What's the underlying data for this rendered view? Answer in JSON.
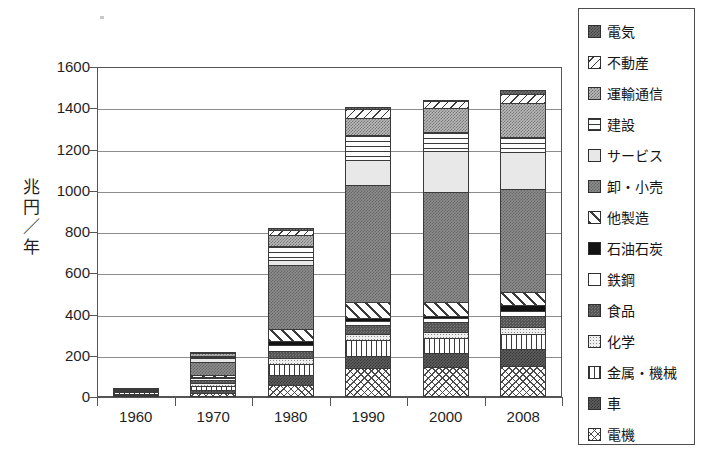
{
  "chart_data": {
    "type": "bar",
    "stacked": true,
    "title": "",
    "xlabel": "",
    "ylabel": "兆円／年",
    "ylabel_chars": [
      "兆",
      "円",
      "／",
      "年"
    ],
    "ylim": [
      0,
      1600
    ],
    "ytick_step": 200,
    "yticks": [
      0,
      200,
      400,
      600,
      800,
      1000,
      1200,
      1400,
      1600
    ],
    "ytick_labels": [
      "0",
      "200",
      "400",
      "600",
      "800",
      "1000",
      "1200",
      "1400",
      "1600"
    ],
    "grid": true,
    "grid_axis": "y",
    "legend_position": "right-outside",
    "categories": [
      "1960",
      "1970",
      "1980",
      "1990",
      "2000",
      "2008"
    ],
    "totals": [
      40,
      215,
      820,
      1405,
      1440,
      1490
    ],
    "stack_order_bottom_to_top": [
      "電機",
      "車",
      "金属・機械",
      "化学",
      "食品",
      "鉄鋼",
      "石油石炭",
      "他製造",
      "卸・小売",
      "サービス",
      "建設",
      "運輸通信",
      "不動産",
      "電気"
    ],
    "series": [
      {
        "name": "電機",
        "pattern": "cross-hatch-fine",
        "color": "#ffffff",
        "values": [
          8,
          18,
          60,
          140,
          145,
          150
        ]
      },
      {
        "name": "車",
        "pattern": "solid-dark-gray",
        "color": "#5e5e5e",
        "values": [
          5,
          14,
          45,
          60,
          70,
          85
        ]
      },
      {
        "name": "金属・機械",
        "pattern": "vertical-lines",
        "color": "#fdfdfd",
        "values": [
          9,
          22,
          55,
          75,
          70,
          70
        ]
      },
      {
        "name": "化学",
        "pattern": "fine-dots",
        "color": "#efefef",
        "values": [
          5,
          12,
          30,
          30,
          28,
          35
        ]
      },
      {
        "name": "食品",
        "pattern": "dark-speckle",
        "color": "#555555",
        "values": [
          6,
          16,
          35,
          45,
          50,
          55
        ]
      },
      {
        "name": "鉄鋼",
        "pattern": "white",
        "color": "#ffffff",
        "values": [
          3,
          9,
          25,
          20,
          18,
          22
        ]
      },
      {
        "name": "石油石炭",
        "pattern": "solid-black",
        "color": "#121212",
        "values": [
          1,
          4,
          20,
          15,
          12,
          30
        ]
      },
      {
        "name": "他製造",
        "pattern": "diagonal-hatch",
        "color": "#ffffff",
        "values": [
          3,
          12,
          60,
          75,
          70,
          60
        ]
      },
      {
        "name": "卸・小売",
        "pattern": "medium-speckle",
        "color": "#8c8c8c",
        "values": [
          0,
          64,
          310,
          570,
          530,
          500
        ]
      },
      {
        "name": "サービス",
        "pattern": "light-gray",
        "color": "#e8e8e8",
        "values": [
          0,
          18,
          25,
          120,
          200,
          180
        ]
      },
      {
        "name": "建設",
        "pattern": "horizontal-lines",
        "color": "#fdfdfd",
        "values": [
          0,
          12,
          65,
          120,
          90,
          75
        ]
      },
      {
        "name": "運輸通信",
        "pattern": "light-speckle",
        "color": "#b9b9b9",
        "values": [
          0,
          10,
          55,
          85,
          120,
          165
        ]
      },
      {
        "name": "不動産",
        "pattern": "sparse-diagonal",
        "color": "#fbfbfb",
        "values": [
          0,
          4,
          25,
          40,
          32,
          43
        ]
      },
      {
        "name": "電気",
        "pattern": "dark-speckle-2",
        "color": "#6f6f6f",
        "values": [
          0,
          0,
          10,
          10,
          5,
          20
        ]
      }
    ]
  },
  "legend": {
    "items": [
      {
        "label": "電気",
        "swatch": "p-denki"
      },
      {
        "label": "不動産",
        "swatch": "p-fudosan"
      },
      {
        "label": "運輸通信",
        "swatch": "p-unyu"
      },
      {
        "label": "建設",
        "swatch": "p-kensetsu"
      },
      {
        "label": "サービス",
        "swatch": "p-service"
      },
      {
        "label": "卸・小売",
        "swatch": "p-oroshi"
      },
      {
        "label": "他製造",
        "swatch": "p-taseizo"
      },
      {
        "label": "石油石炭",
        "swatch": "p-sekiyu"
      },
      {
        "label": "鉄鋼",
        "swatch": "p-tekko"
      },
      {
        "label": "食品",
        "swatch": "p-shokuhin"
      },
      {
        "label": "化学",
        "swatch": "p-kagaku"
      },
      {
        "label": "金属・機械",
        "swatch": "p-kinzoku"
      },
      {
        "label": "車",
        "swatch": "p-kuruma"
      },
      {
        "label": "電機",
        "swatch": "p-denki2"
      }
    ]
  }
}
